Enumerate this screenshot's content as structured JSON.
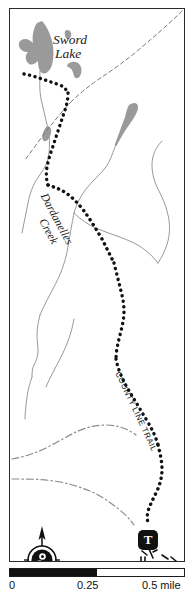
{
  "map": {
    "title": "Sword Lake / County Line Trail area map",
    "labels": {
      "lake_name_line1": "Sword",
      "lake_name_line2": "Lake",
      "creek_name_line1": "Dardanelles",
      "creek_name_line2": "Creek",
      "trail_name": "COUNTY LINE TRAIL"
    },
    "markers": {
      "trailhead_symbol": "T"
    },
    "compass": {
      "direction": "north-arrow"
    },
    "scale": {
      "min_label": "0",
      "mid_label": "0.25",
      "max_label": "0.5 mile"
    },
    "colors": {
      "water_fill": "#9a9a9a",
      "stream_line": "#9a9a9a",
      "trail_dots": "#111111",
      "frame": "#2b2b2b",
      "marker_fill": "#111111",
      "background": "#ffffff"
    }
  }
}
